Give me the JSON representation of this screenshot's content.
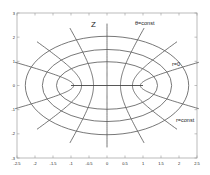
{
  "chart_data": {
    "type": "line",
    "title": "",
    "xlabel": "",
    "ylabel": "",
    "xlim": [
      -2.5,
      2.5
    ],
    "ylim": [
      -3,
      3
    ],
    "grid": false,
    "x_ticks": [
      -2.5,
      -2,
      -1.5,
      -1,
      -0.5,
      0,
      0.5,
      1,
      1.5,
      2,
      2.5
    ],
    "x_tick_labels": [
      "-2.5",
      "-2",
      "-1.5",
      "-1",
      "-0.5",
      "0",
      "0.5",
      "1",
      "1.5",
      "2",
      "2.5"
    ],
    "y_ticks": [
      -3,
      -2,
      -1,
      0,
      1,
      2,
      3
    ],
    "y_tick_labels": [
      "-3",
      "-2",
      "-1",
      "0",
      "1",
      "2",
      "3"
    ],
    "ellipses_r": [
      0.87,
      1.19,
      1.46
    ],
    "ellipse_semi_axes": [
      {
        "a": 1.39,
        "b": 0.97
      },
      {
        "a": 1.8,
        "b": 1.5
      },
      {
        "a": 2.27,
        "b": 2.03
      }
    ],
    "hyperbolae_theta_deg": [
      22,
      45,
      68,
      90,
      112,
      135,
      158
    ],
    "hyperbola_r_max": 1.67,
    "focal_segment": {
      "x": [
        -1,
        1
      ],
      "y": [
        0,
        0
      ]
    },
    "annotations": [
      {
        "text": "Z",
        "x": -0.35,
        "y": 2.5
      },
      {
        "text": "θ=const",
        "x": 0.85,
        "y": 2.6
      },
      {
        "text": "r=0",
        "x": 1.78,
        "y": 0.92
      },
      {
        "text": "r=const",
        "x": 1.95,
        "y": -1.4
      }
    ]
  },
  "labels": {
    "z": "Z",
    "theta_const": "θ=const",
    "r_zero": "r=0",
    "r_const": "r=const"
  },
  "colors": {
    "curve": "#555555",
    "axis": "#999999",
    "text": "#222222"
  }
}
